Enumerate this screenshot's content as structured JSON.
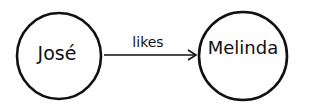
{
  "diagram": {
    "type": "relationship-graph",
    "nodes": [
      {
        "id": "jose",
        "label": "José"
      },
      {
        "id": "melinda",
        "label": "Melinda"
      }
    ],
    "edges": [
      {
        "from": "jose",
        "to": "melinda",
        "label": "likes",
        "directed": true
      }
    ],
    "colors": {
      "stroke": "#111111",
      "background": "#ffffff",
      "text": "#111111"
    }
  }
}
